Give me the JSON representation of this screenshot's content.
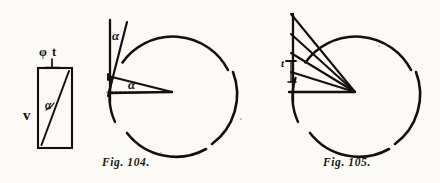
{
  "page": {
    "width": 440,
    "height": 183,
    "background_color": "#fbfaf6",
    "ink_color": "#14110e"
  },
  "figure_left": {
    "name": "velocity-rectangle",
    "top_label": "φ t",
    "side_label": "v",
    "angle_label": "α",
    "rect": {
      "x": 38,
      "y": 68,
      "width": 34,
      "height": 80
    }
  },
  "figure_104": {
    "caption": "Fig. 104.",
    "angle_label_tangent": "α",
    "angle_label_center": "α",
    "circle": {
      "cx": 172,
      "cy": 92,
      "r": 62
    },
    "center_point": {
      "x": 172,
      "y": 92
    }
  },
  "figure_105": {
    "caption": "Fig. 105.",
    "tick_label": "t",
    "circle": {
      "cx": 355,
      "cy": 92,
      "r": 62
    },
    "center_point": {
      "x": 355,
      "y": 92
    },
    "ray_count": 5
  }
}
